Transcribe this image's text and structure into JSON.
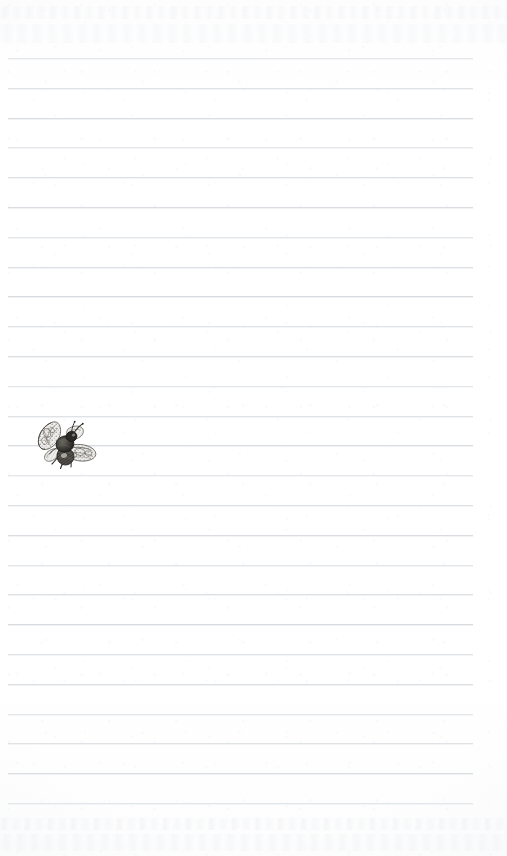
{
  "page": {
    "kind": "scanned-lined-journal-page",
    "width": 507,
    "height": 856,
    "paper_color": "#fefefe",
    "rule_color": "#d6dade"
  },
  "ruling": {
    "line_count": 26,
    "first_line_y": 58,
    "line_spacing": 29.8,
    "line_left_x": 8,
    "line_right_x": 473,
    "line_thickness": 1,
    "color": "#d6dade"
  },
  "illustration": {
    "name": "bee-engraving",
    "label": "Bee",
    "description": "Vintage engraving of a bee with spread patterned wings",
    "ink_color": "#4a4742",
    "wing_color": "#8d8a86",
    "x": 33,
    "y": 422,
    "width": 64,
    "height": 51
  },
  "texture": {
    "bleed_through_top": true,
    "bleed_through_bottom": true,
    "grain": "paper-fiber-mottle"
  }
}
